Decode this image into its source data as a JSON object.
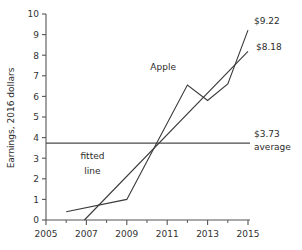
{
  "chart_data": {
    "type": "line",
    "title": "",
    "xlabel": "",
    "ylabel": "Earnings, 2016 dollars",
    "xlim": [
      2005,
      2015
    ],
    "ylim": [
      0,
      10
    ],
    "grid": false,
    "legend_position": "inline-annotations",
    "x_ticks": [
      "2005",
      "2007",
      "2009",
      "2011",
      "2013",
      "2015"
    ],
    "x_tick_values": [
      2005,
      2007,
      2009,
      2011,
      2013,
      2015
    ],
    "x_minor_tick_values": [
      2006,
      2008,
      2010,
      2012,
      2014
    ],
    "y_ticks": [
      "0",
      "1",
      "2",
      "3",
      "4",
      "5",
      "6",
      "7",
      "8",
      "9",
      "10"
    ],
    "y_tick_values": [
      0,
      1,
      2,
      3,
      4,
      5,
      6,
      7,
      8,
      9,
      10
    ],
    "series": [
      {
        "name": "Apple",
        "x": [
          2006,
          2009,
          2012,
          2013,
          2014,
          2015
        ],
        "values": [
          0.4,
          1.0,
          6.55,
          5.8,
          6.6,
          9.22
        ],
        "end_label": "$9.22"
      },
      {
        "name": "fitted line",
        "x": [
          2006.9,
          2015
        ],
        "values": [
          0.0,
          8.18
        ],
        "end_label": "$8.18"
      }
    ],
    "reference_line": {
      "name": "average",
      "value": 3.73,
      "label_value": "$3.73",
      "label_text": "average",
      "x_start": 2005,
      "x_end": 2015.1
    },
    "annotations": [
      {
        "name": "apple-series-label",
        "text": "Apple",
        "x": 2010.8,
        "y": 7.3
      },
      {
        "name": "fitted-line-label-1",
        "text": "fitted",
        "x": 2007.3,
        "y": 2.95
      },
      {
        "name": "fitted-line-label-2",
        "text": "line",
        "x": 2007.3,
        "y": 2.25
      }
    ],
    "colors": {
      "series": "#3a3a3a",
      "axis": "#555555",
      "average": "#4a4a4a",
      "text": "#2b2b2b",
      "background": "#ffffff"
    }
  }
}
